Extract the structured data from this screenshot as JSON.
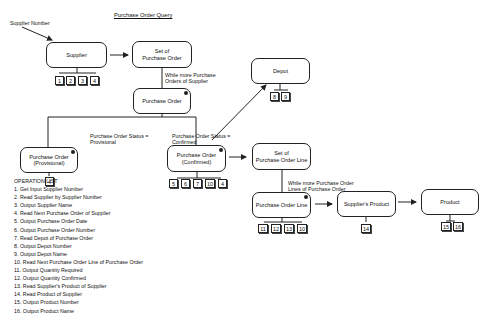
{
  "title": "Purchase Order Query",
  "input_label": "Supplier Number",
  "nodes": {
    "supplier": "Supplier",
    "set_po": "Set of\nPurchase Order",
    "purchase_order": "Purchase Order",
    "po_provisional": "Purchase Order\n(Provisional)",
    "po_confirmed": "Purchase Order\n(Confirmed)",
    "depot": "Depot",
    "set_pol": "Set of\nPurchase Order Line",
    "po_line": "Purchase Order Line",
    "suppliers_product": "Supplier's Product",
    "product": "Product"
  },
  "labels": {
    "while_po": "While more Purchase\nOrders of Supplier",
    "status_provisional": "Purchase Order Status =\nProvisional",
    "status_confirmed": "Purchase Order Status =\nConfirmed",
    "while_pol": "While more Purchase Order\nLines of Purchase Order"
  },
  "ops": {
    "supplier": [
      "1",
      "2",
      "3",
      "4"
    ],
    "provisional": [
      "4"
    ],
    "confirmed": [
      "5",
      "6",
      "7",
      "10",
      "4"
    ],
    "depot": [
      "8",
      "9"
    ],
    "po_line": [
      "11",
      "12",
      "13",
      "10"
    ],
    "suppliers_product": [
      "14"
    ],
    "product": [
      "15",
      "16"
    ]
  },
  "operation_list": {
    "heading": "OPERATION LIST",
    "items": [
      "1. Get Input Supplier Number",
      "2. Read Supplier by Supplier Number",
      "3. Output Supplier Name",
      "4. Read Next Purchase Order of Supplier",
      "5. Output Purchase Order Date",
      "6. Output Purchase Order Number",
      "7. Read Depot of Purchase Order",
      "8. Output Depot Number",
      "9. Output Depot Name",
      "10. Read Next Purchase Order Line of Purchase Order",
      "11. Output Quantity Required",
      "12. Output Quantity Confirmed",
      "13. Read Supplier's Product of Supplier",
      "14. Read Product of Supplier",
      "15. Output Product Number",
      "16. Output Product Name"
    ]
  }
}
